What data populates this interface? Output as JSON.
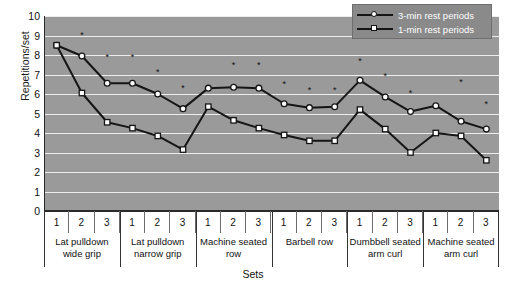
{
  "axes": {
    "ylabel": "Repetitions/set",
    "xlabel": "Sets",
    "yticks": [
      "10",
      "9",
      "8",
      "7",
      "6",
      "5",
      "4",
      "3",
      "2",
      "1",
      "0"
    ]
  },
  "legend": {
    "items": [
      {
        "label": "3-min rest periods",
        "marker": "circle"
      },
      {
        "label": "1-min rest periods",
        "marker": "square"
      }
    ]
  },
  "groups": [
    {
      "name": "Lat pulldown\nwide grip",
      "line1": "Lat pulldown",
      "line2": "wide grip",
      "sets": [
        "1",
        "2",
        "3"
      ]
    },
    {
      "name": "Lat pulldown\nnarrow grip",
      "line1": "Lat pulldown",
      "line2": "narrow grip",
      "sets": [
        "1",
        "2",
        "3"
      ]
    },
    {
      "name": "Machine seated\nrow",
      "line1": "Machine seated",
      "line2": "row",
      "sets": [
        "1",
        "2",
        "3"
      ]
    },
    {
      "name": "Barbell row",
      "line1": "Barbell row",
      "line2": "",
      "sets": [
        "1",
        "2",
        "3"
      ]
    },
    {
      "name": "Dumbbell seated\narm curl",
      "line1": "Dumbbell seated",
      "line2": "arm curl",
      "sets": [
        "1",
        "2",
        "3"
      ]
    },
    {
      "name": "Machine seated\narm curl",
      "line1": "Machine seated",
      "line2": "arm curl",
      "sets": [
        "1",
        "2",
        "3"
      ]
    }
  ],
  "chart_data": {
    "type": "line",
    "title": "",
    "xlabel": "Sets",
    "ylabel": "Repetitions/set",
    "ylim": [
      0,
      10
    ],
    "ytick_step": 1,
    "grid": true,
    "legend_position": "top-right",
    "categories": [
      "Lat pulldown wide grip 1",
      "Lat pulldown wide grip 2",
      "Lat pulldown wide grip 3",
      "Lat pulldown narrow grip 1",
      "Lat pulldown narrow grip 2",
      "Lat pulldown narrow grip 3",
      "Machine seated row 1",
      "Machine seated row 2",
      "Machine seated row 3",
      "Barbell row 1",
      "Barbell row 2",
      "Barbell row 3",
      "Dumbbell seated arm curl 1",
      "Dumbbell seated arm curl 2",
      "Dumbbell seated arm curl 3",
      "Machine seated arm curl 1",
      "Machine seated arm curl 2",
      "Machine seated arm curl 3"
    ],
    "series": [
      {
        "name": "3-min rest periods",
        "marker": "circle",
        "values": [
          8.5,
          7.95,
          6.55,
          6.55,
          6.0,
          5.25,
          6.3,
          6.35,
          6.3,
          5.5,
          5.3,
          5.35,
          6.7,
          5.85,
          5.1,
          5.4,
          4.6,
          4.2
        ]
      },
      {
        "name": "1-min rest periods",
        "marker": "square",
        "values": [
          8.5,
          6.05,
          4.55,
          4.25,
          3.85,
          3.15,
          5.35,
          4.65,
          4.25,
          3.9,
          3.6,
          3.6,
          5.2,
          4.2,
          3.0,
          4.0,
          3.85,
          2.6
        ]
      }
    ],
    "significance_marker": "*",
    "significance_note": "* indicates significant difference between rest period conditions",
    "significance_points": [
      {
        "index": 1,
        "y": 8.85
      },
      {
        "index": 2,
        "y": 7.75
      },
      {
        "index": 3,
        "y": 7.75
      },
      {
        "index": 4,
        "y": 6.95
      },
      {
        "index": 5,
        "y": 6.15
      },
      {
        "index": 7,
        "y": 7.35
      },
      {
        "index": 8,
        "y": 7.35
      },
      {
        "index": 9,
        "y": 6.35
      },
      {
        "index": 10,
        "y": 6.05
      },
      {
        "index": 11,
        "y": 6.05
      },
      {
        "index": 12,
        "y": 7.55
      },
      {
        "index": 13,
        "y": 6.75
      },
      {
        "index": 14,
        "y": 5.9
      },
      {
        "index": 16,
        "y": 6.45
      },
      {
        "index": 17,
        "y": 5.35
      }
    ]
  },
  "colors": {
    "plot_background": "#9a9a9a",
    "gridline": "#ededed",
    "line": "#151515",
    "marker_fill": "#ffffff",
    "legend_background": "#8a8a8a",
    "text": "#111111"
  }
}
